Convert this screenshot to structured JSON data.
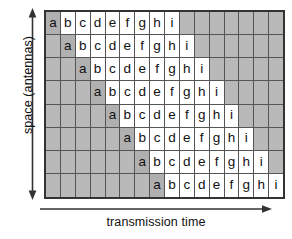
{
  "figure": {
    "name": "space-time-block-transmission-diagram",
    "y_axis": {
      "label": "space (antennas)",
      "arrow": "double-headed-vertical-arrow"
    },
    "x_axis": {
      "label": "transmission time",
      "arrow": "right-arrow"
    }
  },
  "chart_data": {
    "type": "heatmap",
    "title": "",
    "xlabel": "transmission time",
    "ylabel": "space (antennas)",
    "rows": 8,
    "columns": 16,
    "symbols": [
      "a",
      "b",
      "c",
      "d",
      "e",
      "f",
      "g",
      "h",
      "i"
    ],
    "colors": {
      "empty_cell": "#b9b9b9",
      "letter_cell": "#ffffff",
      "first_symbol_cell": "#b0b0b0",
      "grid_line": "#555555",
      "border": "#333333",
      "text": "#111111"
    },
    "grid": [
      [
        "a",
        "b",
        "c",
        "d",
        "e",
        "f",
        "g",
        "h",
        "i",
        "",
        "",
        "",
        "",
        "",
        "",
        ""
      ],
      [
        "",
        "a",
        "b",
        "c",
        "d",
        "e",
        "f",
        "g",
        "h",
        "i",
        "",
        "",
        "",
        "",
        "",
        ""
      ],
      [
        "",
        "",
        "a",
        "b",
        "c",
        "d",
        "e",
        "f",
        "g",
        "h",
        "i",
        "",
        "",
        "",
        "",
        ""
      ],
      [
        "",
        "",
        "",
        "a",
        "b",
        "c",
        "d",
        "e",
        "f",
        "g",
        "h",
        "i",
        "",
        "",
        "",
        ""
      ],
      [
        "",
        "",
        "",
        "",
        "a",
        "b",
        "c",
        "d",
        "e",
        "f",
        "g",
        "h",
        "i",
        "",
        "",
        ""
      ],
      [
        "",
        "",
        "",
        "",
        "",
        "a",
        "b",
        "c",
        "d",
        "e",
        "f",
        "g",
        "h",
        "i",
        "",
        ""
      ],
      [
        "",
        "",
        "",
        "",
        "",
        "",
        "a",
        "b",
        "c",
        "d",
        "e",
        "f",
        "g",
        "h",
        "i",
        ""
      ],
      [
        "",
        "",
        "",
        "",
        "",
        "",
        "",
        "a",
        "b",
        "c",
        "d",
        "e",
        "f",
        "g",
        "h",
        "i"
      ]
    ]
  }
}
